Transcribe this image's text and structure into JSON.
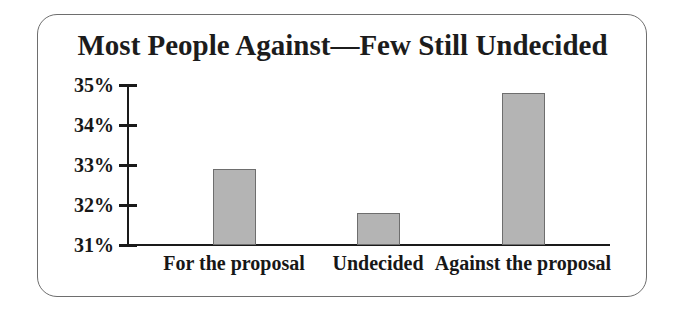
{
  "frame": {
    "border_color": "#6e6e6e",
    "background": "#ffffff"
  },
  "chart_data": {
    "type": "bar",
    "title": "Most People Against—Few Still Undecided",
    "categories": [
      "For the proposal",
      "Undecided",
      "Against the proposal"
    ],
    "values": [
      32.9,
      31.8,
      34.8
    ],
    "xlabel": "",
    "ylabel": "",
    "ylim": [
      31,
      35
    ],
    "yticks": [
      31,
      32,
      33,
      34,
      35
    ],
    "ytick_labels": [
      "31%",
      "32%",
      "33%",
      "34%",
      "35%"
    ],
    "grid": false,
    "legend": null,
    "bar_color": "#b4b4b4",
    "bar_border_color": "#6e6e6e",
    "axis_color": "#1a1a1a",
    "text_color": "#171717"
  }
}
